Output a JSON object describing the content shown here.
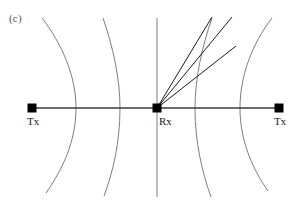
{
  "figure": {
    "panel_label": "(c)",
    "panel_label_color": "#58585a",
    "background_color": "#ffffff",
    "width": 301,
    "height": 208,
    "baseline_color": "#3a3a3a",
    "curve_color": "#6e6e70",
    "ray_color": "#1c1c1c",
    "marker_color": "#000000"
  },
  "nodes": [
    {
      "id": "tx-left",
      "label": "Tx",
      "x": 32,
      "y": 108,
      "marker": "filled-square"
    },
    {
      "id": "rx-center",
      "label": "Rx",
      "x": 157,
      "y": 108,
      "marker": "filled-square"
    },
    {
      "id": "tx-right",
      "label": "Tx",
      "x": 279,
      "y": 108,
      "marker": "filled-square"
    }
  ],
  "baseline": {
    "name": "tx-rx-tx-baseline",
    "x1": 32,
    "y1": 108,
    "x2": 279,
    "y2": 108
  },
  "curves": [
    {
      "id": "iso-range-curve-1",
      "bulge": "right",
      "top_x": 42,
      "vertex_x": 76,
      "bottom_x": 46,
      "top_y": 18,
      "vertex_y": 108,
      "bottom_y": 193
    },
    {
      "id": "iso-range-curve-2",
      "bulge": "right",
      "top_x": 103,
      "vertex_x": 120,
      "bottom_x": 104,
      "top_y": 18,
      "vertex_y": 108,
      "bottom_y": 196
    },
    {
      "id": "perpendicular-bisector",
      "bulge": "none",
      "top_x": 157,
      "vertex_x": 157,
      "bottom_x": 157,
      "top_y": 18,
      "vertex_y": 108,
      "bottom_y": 197
    },
    {
      "id": "iso-range-curve-4",
      "bulge": "left",
      "top_x": 212,
      "vertex_x": 195,
      "bottom_x": 211,
      "top_y": 18,
      "vertex_y": 108,
      "bottom_y": 197
    },
    {
      "id": "iso-range-curve-5",
      "bulge": "left",
      "top_x": 272,
      "vertex_x": 240,
      "bottom_x": 268,
      "top_y": 18,
      "vertex_y": 108,
      "bottom_y": 191
    }
  ],
  "rays": [
    {
      "id": "ray-1",
      "from_x": 157,
      "from_y": 108,
      "to_x": 212,
      "to_y": 17
    },
    {
      "id": "ray-2",
      "from_x": 157,
      "from_y": 108,
      "to_x": 232,
      "to_y": 17
    },
    {
      "id": "ray-3",
      "from_x": 157,
      "from_y": 108,
      "to_x": 236,
      "to_y": 46
    }
  ]
}
